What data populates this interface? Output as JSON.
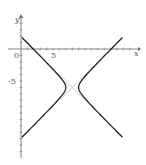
{
  "chart_data": {
    "type": "line",
    "title": "",
    "xlabel": "x",
    "ylabel": "y",
    "xlim": [
      -1,
      17
    ],
    "ylim": [
      -19,
      5
    ],
    "grid": false,
    "legend": "none",
    "tick_labels": {
      "x": [
        "0",
        "5"
      ],
      "y": [
        "-5"
      ]
    },
    "origin_label": "0",
    "series": [
      {
        "name": "hyperbola",
        "equation": "(x-8)^2 - (y+6)^2 = 1",
        "center": [
          8,
          -6
        ],
        "a": 1,
        "b": 1,
        "color": "#222222",
        "style": "solid"
      },
      {
        "name": "asymptote-1",
        "equation": "y = -x + 2",
        "color": "#aaaaaa",
        "style": "thin"
      },
      {
        "name": "asymptote-2",
        "equation": "y = x - 14",
        "color": "#aaaaaa",
        "style": "thin"
      }
    ]
  },
  "axes": {
    "x_label": "x",
    "y_label": "y",
    "origin": "0",
    "x_tick_5": "5",
    "y_tick_neg5": "-5"
  }
}
